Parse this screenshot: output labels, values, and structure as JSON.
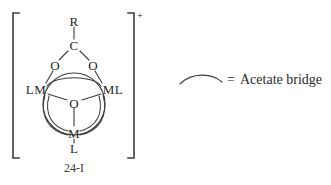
{
  "figure": {
    "compound_label": "24-I",
    "charge": "+",
    "atoms": {
      "r_group": "R",
      "carbon": "C",
      "oxygen_left": "O",
      "oxygen_right": "O",
      "metal_left": "LM",
      "metal_right": "ML",
      "oxygen_center": "O",
      "metal_bottom": "M",
      "ligand_bottom": "L"
    }
  },
  "legend": {
    "equals": "=",
    "description": "Acetate bridge",
    "arc_icon": "acetate-bridge-arc"
  },
  "colors": {
    "background": "#ffffff",
    "ink": "#2b2b2b",
    "line": "#3c3c3c"
  }
}
